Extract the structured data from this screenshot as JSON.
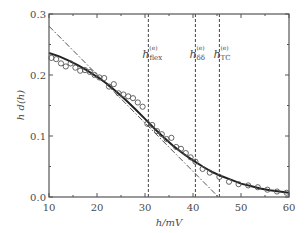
{
  "chart_data": {
    "type": "line",
    "title": "",
    "xlabel": "h/mV",
    "ylabel": "h d(h)",
    "xlim": [
      10,
      60
    ],
    "ylim": [
      0.0,
      0.3
    ],
    "xticks": [
      10,
      20,
      30,
      40,
      50,
      60
    ],
    "xtick_labels": [
      "10",
      "20",
      "30",
      "40",
      "50",
      "60"
    ],
    "yticks": [
      0.0,
      0.1,
      0.2,
      0.3
    ],
    "ytick_labels": [
      "0.0",
      "0.1",
      "0.2",
      "0.3"
    ],
    "grid": false,
    "legend": null,
    "series": [
      {
        "name": "experimental data",
        "style": "open circles",
        "x": [
          10.5,
          11.5,
          12.5,
          13.5,
          14.5,
          15.5,
          16.5,
          17.5,
          18.5,
          19.5,
          20.5,
          21.5,
          22.5,
          23.5,
          24.5,
          25.5,
          26.5,
          27.5,
          28.5,
          29.5,
          30.5,
          31.5,
          32.5,
          33.5,
          34.5,
          35.5,
          36.5,
          37.5,
          38.5,
          39.5,
          40.5,
          42,
          43.5,
          45.5,
          47.5,
          49.5,
          51.5,
          53.5,
          55.5,
          57.5,
          59.5
        ],
        "values": [
          0.228,
          0.226,
          0.219,
          0.214,
          0.219,
          0.212,
          0.207,
          0.208,
          0.205,
          0.2,
          0.196,
          0.195,
          0.181,
          0.185,
          0.17,
          0.168,
          0.165,
          0.162,
          0.155,
          0.148,
          0.12,
          0.118,
          0.108,
          0.103,
          0.095,
          0.097,
          0.082,
          0.079,
          0.072,
          0.065,
          0.058,
          0.046,
          0.04,
          0.033,
          0.025,
          0.021,
          0.019,
          0.016,
          0.012,
          0.009,
          0.007
        ]
      },
      {
        "name": "model fit",
        "style": "solid thick",
        "x": [
          10,
          12,
          14,
          16,
          18,
          20,
          22,
          24,
          26,
          28,
          30,
          32,
          34,
          36,
          38,
          40,
          42,
          44,
          46,
          48,
          50,
          52,
          54,
          56,
          58,
          60
        ],
        "values": [
          0.236,
          0.231,
          0.224,
          0.216,
          0.207,
          0.197,
          0.186,
          0.173,
          0.159,
          0.144,
          0.128,
          0.112,
          0.097,
          0.083,
          0.071,
          0.06,
          0.05,
          0.041,
          0.034,
          0.028,
          0.022,
          0.018,
          0.014,
          0.011,
          0.009,
          0.007
        ]
      },
      {
        "name": "tangent at inflection",
        "style": "dash-dot",
        "x": [
          10,
          45.3
        ],
        "values": [
          0.28,
          0.0
        ]
      }
    ],
    "annotations": [
      {
        "x": 30.7,
        "main": "h",
        "sup": "(e)",
        "sub": "flex",
        "style": "vertical dashed line"
      },
      {
        "x": 40.5,
        "main": "h",
        "sup": "(e)",
        "sub": "δδ",
        "style": "vertical dashed line"
      },
      {
        "x": 45.5,
        "main": "h",
        "sup": "(e)",
        "sub": "TC",
        "style": "vertical dashed line"
      }
    ]
  },
  "colors": {
    "axis": "#555555",
    "data": "#555555",
    "fit": "#222222",
    "background": "#ffffff"
  }
}
